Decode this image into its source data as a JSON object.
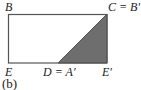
{
  "figure": {
    "caption": "(b)",
    "labels": {
      "B": "B",
      "C": "C = B′",
      "E": "E",
      "D": "D = A′",
      "E_prime": "E′"
    },
    "colors": {
      "stroke": "#555555",
      "shaded": "#6e6e6e",
      "background": "#ffffff"
    },
    "rectangle": {
      "x": 8,
      "y": 14,
      "width": 99,
      "height": 49
    },
    "shaded_triangle": {
      "points": "58,63 107,14 107,63"
    }
  }
}
